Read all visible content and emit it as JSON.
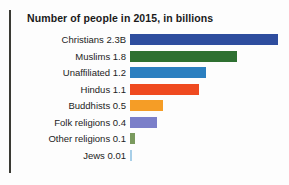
{
  "chart_data": {
    "type": "bar",
    "orientation": "horizontal",
    "title": "Number of people in 2015, in billions",
    "xlabel": "",
    "ylabel": "",
    "xlim": [
      0,
      2.5
    ],
    "grid": false,
    "legend": "none",
    "unit": "billions",
    "categories": [
      "Christians",
      "Muslims",
      "Unaffiliated",
      "Hindus",
      "Buddhists",
      "Folk religions",
      "Other religions",
      "Jews"
    ],
    "values": [
      2.3,
      1.8,
      1.2,
      1.1,
      0.5,
      0.4,
      0.1,
      0.01
    ],
    "value_labels": [
      "2.3B",
      "1.8",
      "1.2",
      "1.1",
      "0.5",
      "0.4",
      "0.1",
      "0.01"
    ],
    "tick_labels": [
      "Christians 2.3B",
      "Muslims 1.8",
      "Unaffiliated 1.2",
      "Hindus 1.1",
      "Buddhists 0.5",
      "Folk religions 0.4",
      "Other religions 0.1",
      "Jews 0.01"
    ],
    "colors": [
      "#2e4d9e",
      "#2e7031",
      "#2b7fc0",
      "#ef4a20",
      "#f59d26",
      "#7b7fc9",
      "#7a9a5e",
      "#a8cfe8"
    ],
    "bars": [
      {
        "label": "Christians 2.3B",
        "category": "Christians",
        "value": 2.3,
        "color": "#2e4d9e",
        "pixel_width": 148
      },
      {
        "label": "Muslims 1.8",
        "category": "Muslims",
        "value": 1.8,
        "color": "#2e7031",
        "pixel_width": 107
      },
      {
        "label": "Unaffiliated 1.2",
        "category": "Unaffiliated",
        "value": 1.2,
        "color": "#2b7fc0",
        "pixel_width": 76
      },
      {
        "label": "Hindus 1.1",
        "category": "Hindus",
        "value": 1.1,
        "color": "#ef4a20",
        "pixel_width": 69
      },
      {
        "label": "Buddhists 0.5",
        "category": "Buddhists",
        "value": 0.5,
        "color": "#f59d26",
        "pixel_width": 33
      },
      {
        "label": "Folk religions 0.4",
        "category": "Folk religions",
        "value": 0.4,
        "color": "#7b7fc9",
        "pixel_width": 27
      },
      {
        "label": "Other religions 0.1",
        "category": "Other religions",
        "value": 0.1,
        "color": "#7a9a5e",
        "pixel_width": 5
      },
      {
        "label": "Jews 0.01",
        "category": "Jews",
        "value": 0.01,
        "color": "#a8cfe8",
        "pixel_width": 2
      }
    ]
  }
}
